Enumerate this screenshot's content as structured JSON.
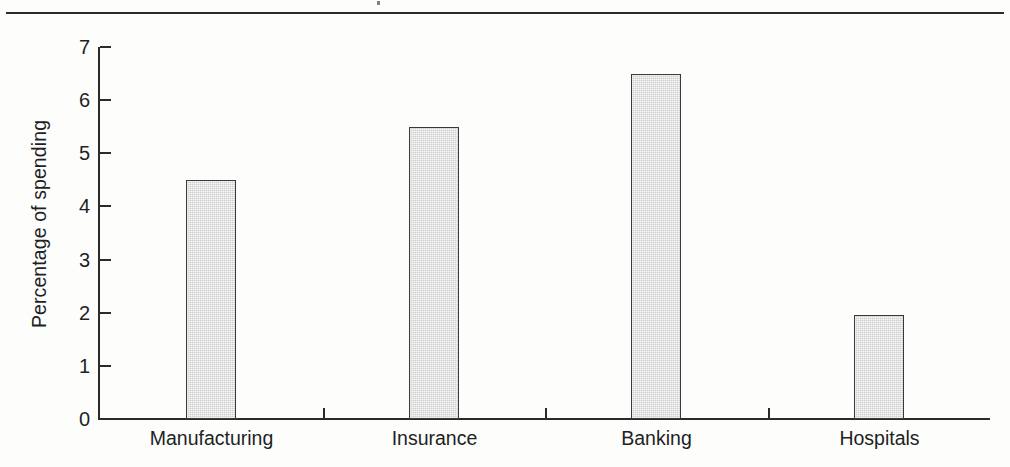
{
  "figure": {
    "top_rule": true,
    "background_color": "#fdfdfc",
    "ink_color": "#221f1f"
  },
  "chart_data": {
    "type": "bar",
    "title": "",
    "subtitle": "",
    "xlabel": "",
    "ylabel": "Percentage of spending",
    "categories": [
      "Manufacturing",
      "Insurance",
      "Banking",
      "Hospitals"
    ],
    "values": [
      4.5,
      5.5,
      6.5,
      1.95
    ],
    "series": [
      {
        "name": "Percentage of spending",
        "values": [
          4.5,
          5.5,
          6.5,
          1.95
        ]
      }
    ],
    "ylim": [
      0,
      7
    ],
    "ytick_labels": [
      "0",
      "1",
      "2",
      "3",
      "4",
      "5",
      "6",
      "7"
    ],
    "ytick_values": [
      0,
      1,
      2,
      3,
      4,
      5,
      6,
      7
    ],
    "grid": false,
    "legend": false,
    "legend_position": "none",
    "bar_fill_color": "#cfcfcf",
    "bar_edge_color": "#3a3a3a",
    "axis_color": "#2b2b2b",
    "annotations": []
  }
}
